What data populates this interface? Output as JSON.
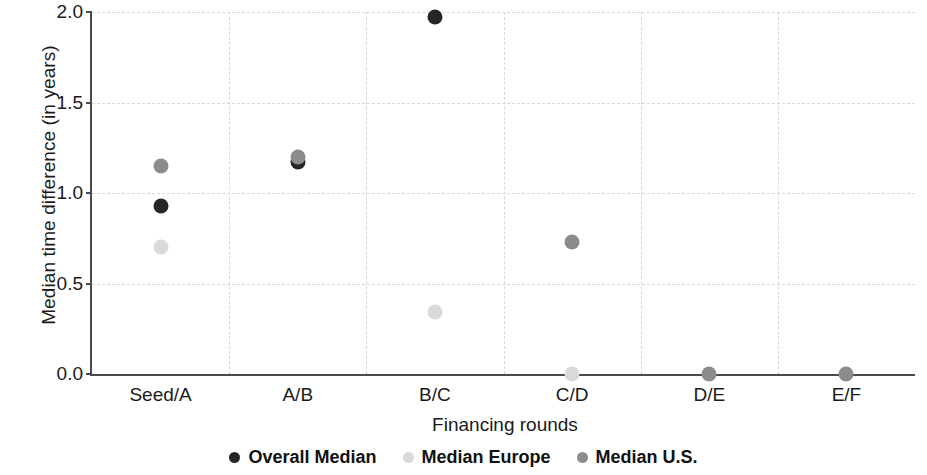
{
  "chart_data": {
    "type": "scatter",
    "title": "",
    "xlabel": "Financing rounds",
    "ylabel": "Median time difference (in years)",
    "categories": [
      "Seed/A",
      "A/B",
      "B/C",
      "C/D",
      "D/E",
      "E/F"
    ],
    "ylim": [
      0.0,
      2.0
    ],
    "yticks": [
      "0.0",
      "0.5",
      "1.0",
      "1.5",
      "2.0"
    ],
    "ytick_values": [
      0.0,
      0.5,
      1.0,
      1.5,
      2.0
    ],
    "grid": true,
    "legend_position": "bottom",
    "series": [
      {
        "name": "Overall Median",
        "color": "#262626",
        "values": [
          0.93,
          1.17,
          1.97,
          null,
          null,
          null
        ]
      },
      {
        "name": "Median Europe",
        "color": "#d9d9d9",
        "values": [
          0.7,
          null,
          0.34,
          0.0,
          null,
          null
        ]
      },
      {
        "name": "Median U.S.",
        "color": "#8c8c8c",
        "values": [
          1.15,
          1.2,
          null,
          0.73,
          0.0,
          0.0
        ]
      }
    ]
  },
  "legend": {
    "items": [
      {
        "label": "Overall Median",
        "color": "#262626"
      },
      {
        "label": "Median Europe",
        "color": "#d9d9d9"
      },
      {
        "label": "Median U.S.",
        "color": "#8c8c8c"
      }
    ]
  },
  "axes": {
    "x_title": "Financing rounds",
    "y_title": "Median time difference (in years)"
  }
}
